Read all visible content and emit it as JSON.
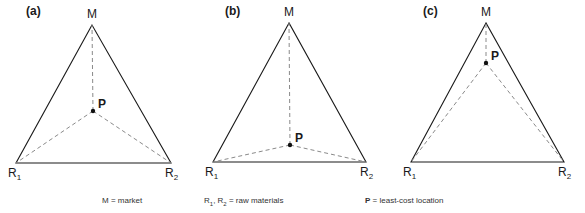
{
  "chart_data": {
    "type": "diagram",
    "panels": [
      {
        "id": "a",
        "label": "(a)",
        "label_pos": [
          26,
          15
        ],
        "M": [
          92,
          25
        ],
        "R1": [
          16,
          163
        ],
        "R2": [
          171,
          163
        ],
        "P": [
          93,
          111
        ]
      },
      {
        "id": "b",
        "label": "(b)",
        "label_pos": [
          225,
          15
        ],
        "M": [
          289,
          23
        ],
        "R1": [
          213,
          162
        ],
        "R2": [
          366,
          162
        ],
        "P": [
          290,
          145
        ]
      },
      {
        "id": "c",
        "label": "(c)",
        "label_pos": [
          423,
          15
        ],
        "M": [
          486,
          23
        ],
        "R1": [
          411,
          162
        ],
        "R2": [
          564,
          162
        ],
        "P": [
          486,
          63
        ]
      }
    ]
  },
  "vertex_labels": {
    "market": "M",
    "raw1": "R",
    "raw1_sub": "1",
    "raw2": "R",
    "raw2_sub": "2",
    "point": "P"
  },
  "legend": {
    "market": "M  =  market",
    "raw_prefix_r1": "R",
    "raw_sub1": "1",
    "raw_sep": ", R",
    "raw_sub2": "2",
    "raw_text": "  =  raw materials",
    "point_key": "P",
    "point_text": "  =  least-cost location"
  },
  "colors": {
    "solid": "#1a1a1a",
    "dashed": "#8a8a8a",
    "point": "#111111"
  }
}
